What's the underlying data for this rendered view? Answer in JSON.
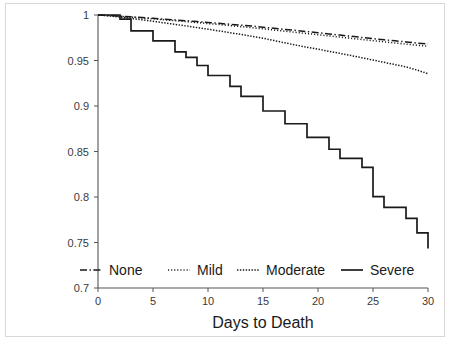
{
  "chart_data": {
    "type": "line",
    "title": "",
    "xlabel": "Days to Death",
    "ylabel": "",
    "xlim": [
      0,
      30
    ],
    "ylim": [
      0.7,
      1.0
    ],
    "grid": false,
    "legend_position": "bottom",
    "xticks": [
      0,
      5,
      10,
      15,
      20,
      25,
      30
    ],
    "xtick_labels": [
      "0",
      "5",
      "10",
      "15",
      "20",
      "25",
      "30"
    ],
    "yticks": [
      0.7,
      0.75,
      0.8,
      0.85,
      0.9,
      0.95,
      1
    ],
    "ytick_labels": [
      "0.7",
      "0.75",
      "0.8",
      "0.85",
      "0.9",
      "0.95",
      "1"
    ],
    "series": [
      {
        "name": "None",
        "linestyle": "dashdot",
        "color": "#1a1a1a",
        "x": [
          0,
          1,
          2,
          3,
          4,
          5,
          6,
          7,
          8,
          9,
          10,
          11,
          12,
          13,
          14,
          15,
          16,
          17,
          18,
          19,
          20,
          21,
          22,
          23,
          24,
          25,
          26,
          27,
          28,
          29,
          30
        ],
        "y": [
          1.0,
          0.9995,
          0.9988,
          0.998,
          0.9972,
          0.9963,
          0.9955,
          0.9946,
          0.9937,
          0.9928,
          0.9918,
          0.9908,
          0.9898,
          0.9888,
          0.9878,
          0.9866,
          0.9854,
          0.9842,
          0.983,
          0.9818,
          0.9805,
          0.9792,
          0.9779,
          0.9766,
          0.9753,
          0.974,
          0.9728,
          0.9716,
          0.9704,
          0.9692,
          0.968
        ]
      },
      {
        "name": "Mild",
        "linestyle": "dotted",
        "color": "#1a1a1a",
        "x": [
          0,
          1,
          2,
          3,
          4,
          5,
          6,
          7,
          8,
          9,
          10,
          11,
          12,
          13,
          14,
          15,
          16,
          17,
          18,
          19,
          20,
          21,
          22,
          23,
          24,
          25,
          26,
          27,
          28,
          29,
          30
        ],
        "y": [
          1.0,
          0.9993,
          0.9985,
          0.9976,
          0.9967,
          0.9957,
          0.9947,
          0.9937,
          0.9927,
          0.9917,
          0.9906,
          0.9895,
          0.9884,
          0.9872,
          0.986,
          0.9848,
          0.9835,
          0.9822,
          0.9809,
          0.9796,
          0.9783,
          0.977,
          0.9757,
          0.9744,
          0.9731,
          0.9718,
          0.9705,
          0.9692,
          0.968,
          0.9668,
          0.9656
        ]
      },
      {
        "name": "Moderate",
        "linestyle": "densely-dotted",
        "color": "#1a1a1a",
        "x": [
          0,
          1,
          2,
          3,
          4,
          5,
          6,
          7,
          8,
          9,
          10,
          11,
          12,
          13,
          14,
          15,
          16,
          17,
          18,
          19,
          20,
          21,
          22,
          23,
          24,
          25,
          26,
          27,
          28,
          29,
          30
        ],
        "y": [
          1.0,
          0.999,
          0.9978,
          0.9963,
          0.9947,
          0.9931,
          0.9914,
          0.9897,
          0.988,
          0.9862,
          0.9844,
          0.9825,
          0.9806,
          0.9786,
          0.9766,
          0.9745,
          0.9719,
          0.9694,
          0.9669,
          0.9646,
          0.9624,
          0.9601,
          0.9578,
          0.9554,
          0.953,
          0.9505,
          0.948,
          0.9455,
          0.943,
          0.9395,
          0.9355
        ]
      },
      {
        "name": "Severe",
        "linestyle": "solid",
        "color": "#1a1a1a",
        "step": true,
        "x": [
          0,
          1,
          2,
          3,
          4,
          5,
          6,
          7,
          8,
          9,
          10,
          11,
          12,
          13,
          14,
          15,
          16,
          17,
          18,
          19,
          20,
          21,
          22,
          23,
          24,
          25,
          26,
          27,
          28,
          29,
          30
        ],
        "y": [
          1.0,
          1.0,
          0.9955,
          0.9825,
          0.9825,
          0.9715,
          0.9715,
          0.9595,
          0.9535,
          0.9445,
          0.9335,
          0.9335,
          0.9215,
          0.9105,
          0.9105,
          0.8945,
          0.8945,
          0.8805,
          0.8805,
          0.8655,
          0.8655,
          0.8525,
          0.8425,
          0.8425,
          0.8325,
          0.8005,
          0.7885,
          0.7885,
          0.7765,
          0.7605,
          0.7435
        ]
      }
    ],
    "legend_entries": [
      {
        "label": "None",
        "linestyle": "dashdot"
      },
      {
        "label": "Mild",
        "linestyle": "dotted"
      },
      {
        "label": "Moderate",
        "linestyle": "densely-dotted"
      },
      {
        "label": "Severe",
        "linestyle": "solid"
      }
    ]
  }
}
